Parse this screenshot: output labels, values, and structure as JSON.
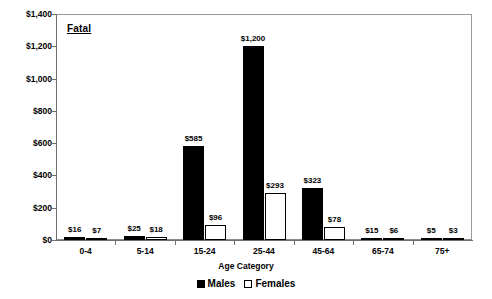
{
  "chart_data": {
    "type": "bar",
    "title": "Fatal",
    "xlabel": "Age Category",
    "ylabel": "",
    "ylim": [
      0,
      1400
    ],
    "ytick_step": 200,
    "grid": false,
    "legend_position": "bottom",
    "categories": [
      "0-4",
      "5-14",
      "15-24",
      "25-44",
      "45-64",
      "65-74",
      "75+"
    ],
    "ytick_labels": [
      "$0",
      "$200",
      "$400",
      "$600",
      "$800",
      "$1,000",
      "$1,200",
      "$1,400"
    ],
    "ytick_values": [
      0,
      200,
      400,
      600,
      800,
      1000,
      1200,
      1400
    ],
    "series": [
      {
        "name": "Males",
        "color": "#000000",
        "values": [
          16,
          25,
          585,
          1200,
          323,
          15,
          5
        ],
        "labels": [
          "$16",
          "$25",
          "$585",
          "$1,200",
          "$323",
          "$15",
          "$5"
        ]
      },
      {
        "name": "Females",
        "color": "#ffffff",
        "values": [
          7,
          18,
          96,
          293,
          78,
          6,
          3
        ],
        "labels": [
          "$7",
          "$18",
          "$96",
          "$293",
          "$78",
          "$6",
          "$3"
        ]
      }
    ]
  },
  "legend": {
    "items": [
      {
        "label": "Males",
        "swatch": "filled-square-icon"
      },
      {
        "label": "Females",
        "swatch": "open-square-icon"
      }
    ]
  }
}
